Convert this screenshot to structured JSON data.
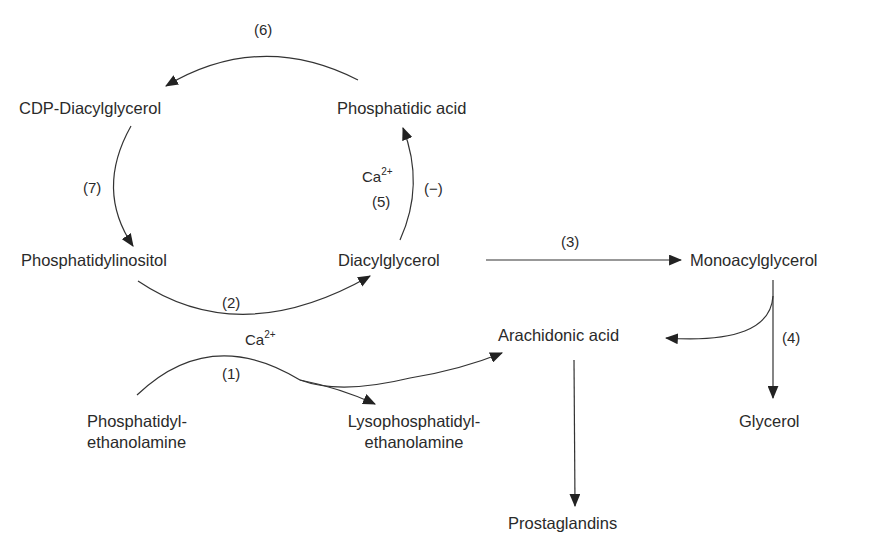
{
  "diagram": {
    "type": "metabolic pathway",
    "nodes": {
      "cdp_diacylglycerol": "CDP-Diacylglycerol",
      "phosphatidic_acid": "Phosphatidic acid",
      "phosphatidylinositol": "Phosphatidylinositol",
      "diacylglycerol": "Diacylglycerol",
      "monoacylglycerol": "Monoacylglycerol",
      "arachidonic_acid": "Arachidonic acid",
      "pe_line1": "Phosphatidyl-",
      "pe_line2": "ethanolamine",
      "lpe_line1": "Lysophosphatidyl-",
      "lpe_line2": "ethanolamine",
      "glycerol": "Glycerol",
      "prostaglandins": "Prostaglandins"
    },
    "step_labels": {
      "s1": "(1)",
      "s2": "(2)",
      "s3": "(3)",
      "s4": "(4)",
      "s5": "(5)",
      "s6": "(6)",
      "s7": "(7)",
      "inhibit": "(−)"
    },
    "cofactor": {
      "base": "Ca",
      "charge": "2+"
    },
    "edges": [
      {
        "step": "(1)",
        "from": "Phosphatidylethanolamine",
        "to": [
          "Lysophosphatidylethanolamine",
          "Arachidonic acid"
        ],
        "cofactor": "Ca2+"
      },
      {
        "step": "(2)",
        "from": "Phosphatidylinositol",
        "to": "Diacylglycerol",
        "cofactor": "Ca2+"
      },
      {
        "step": "(3)",
        "from": "Diacylglycerol",
        "to": "Monoacylglycerol"
      },
      {
        "step": "(4)",
        "from": "Monoacylglycerol",
        "to": [
          "Glycerol",
          "Arachidonic acid"
        ]
      },
      {
        "step": "(5)",
        "from": "Diacylglycerol",
        "to": "Phosphatidic acid",
        "cofactor": "Ca2+",
        "modifier": "(−)"
      },
      {
        "step": "(6)",
        "from": "Phosphatidic acid",
        "to": "CDP-Diacylglycerol"
      },
      {
        "step": "(7)",
        "from": "CDP-Diacylglycerol",
        "to": "Phosphatidylinositol"
      },
      {
        "step": "",
        "from": "Arachidonic acid",
        "to": "Prostaglandins"
      }
    ],
    "colors": {
      "line": "#333333",
      "text": "#2a2a2a",
      "background": "#ffffff"
    }
  }
}
